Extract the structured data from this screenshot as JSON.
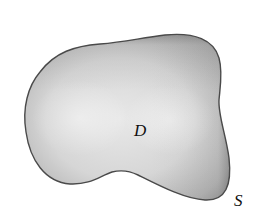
{
  "figure": {
    "region_label": "D",
    "surface_label": "S",
    "colors": {
      "background": "#ffffff",
      "region_center": "#e6e6e6",
      "region_edge": "#5a5a5a",
      "outline": "#444444",
      "label": "#111111"
    }
  }
}
